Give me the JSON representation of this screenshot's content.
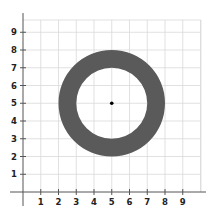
{
  "chart_data": {
    "type": "scatter",
    "title": "",
    "xlabel": "",
    "ylabel": "",
    "xlim": [
      0,
      10
    ],
    "ylim": [
      0,
      10
    ],
    "grid": true,
    "x_ticks": [
      "1",
      "2",
      "3",
      "4",
      "5",
      "6",
      "7",
      "8",
      "9"
    ],
    "y_ticks": [
      "1",
      "2",
      "3",
      "4",
      "5",
      "6",
      "7",
      "8",
      "9"
    ],
    "shapes": [
      {
        "kind": "annulus",
        "center": [
          5,
          5
        ],
        "outer_radius": 3,
        "inner_radius": 2,
        "fill": "#5a5a5a"
      }
    ],
    "points": [
      {
        "x": 5,
        "y": 5,
        "label": "center",
        "color": "#000000"
      }
    ]
  }
}
